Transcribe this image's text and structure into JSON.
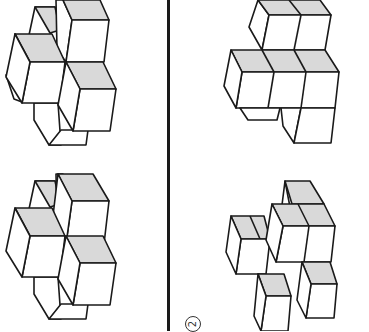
{
  "figure": {
    "type": "cube-puzzle",
    "panels": [
      {
        "id": "top-left",
        "description": "cluster of cubes, pinwheel arrangement"
      },
      {
        "id": "top-right",
        "description": "stacked cubes, two on top, three in middle, one below"
      },
      {
        "id": "bottom-left",
        "description": "cluster of cubes, pinwheel arrangement"
      },
      {
        "id": "bottom-right",
        "description": "scattered cubes arrangement"
      }
    ],
    "option_label": "2",
    "colors": {
      "line": "#1a1a1a",
      "top_face": "#d9d9d9",
      "background": "#ffffff"
    }
  }
}
